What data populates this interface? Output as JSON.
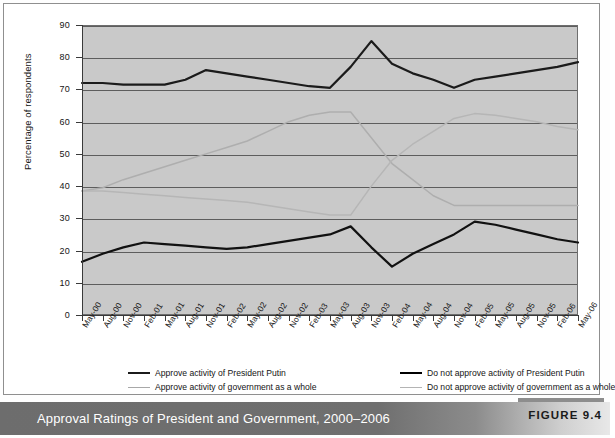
{
  "figure": {
    "caption": "Approval Ratings of President and Government, 2000–2006",
    "number_label": "FIGURE 9.4"
  },
  "chart_data": {
    "type": "line",
    "title": "Approval Ratings of President and Government, 2000–2006",
    "xlabel": "",
    "ylabel": "Percentage of respondents",
    "ylim": [
      0,
      90
    ],
    "yticks": [
      0,
      10,
      20,
      30,
      40,
      50,
      60,
      70,
      80,
      90
    ],
    "grid": true,
    "legend_position": "below-axes",
    "categories": [
      "May-00",
      "Aug-00",
      "Nov-00",
      "Feb-01",
      "May-01",
      "Aug-01",
      "Nov-01",
      "Feb-02",
      "May-02",
      "Aug-02",
      "Nov-02",
      "Feb-03",
      "May-03",
      "Aug-03",
      "Nov-03",
      "Feb-04",
      "May-04",
      "Aug-04",
      "Nov-04",
      "Feb-05",
      "May-05",
      "Aug-05",
      "Nov-05",
      "Feb-06",
      "May-06"
    ],
    "series": [
      {
        "name": "Approve  activity of President Putin",
        "color": "#1b1b1b",
        "width": 2.2,
        "values": [
          72,
          72,
          71.5,
          71.5,
          71.5,
          73,
          76,
          75,
          74,
          73,
          72,
          71,
          70.5,
          77,
          85,
          78,
          75,
          73,
          70.5,
          73,
          74,
          75,
          76,
          77,
          78.5
        ]
      },
      {
        "name": "Do not approve activity of President Putin",
        "color": "#111111",
        "width": 2.2,
        "values": [
          16.5,
          19,
          21,
          22.5,
          22,
          21.5,
          21,
          20.5,
          21,
          22,
          23,
          24,
          25,
          27.5,
          21,
          15,
          19,
          22,
          25,
          29,
          28,
          26.5,
          25,
          23.5,
          22.5
        ]
      },
      {
        "name": "Approve  activity of government as a whole",
        "color": "#aeaeae",
        "width": 1.5,
        "values": [
          38.5,
          39.5,
          42,
          44,
          46,
          48,
          50,
          52,
          54,
          57,
          60,
          62,
          63,
          63,
          55,
          47,
          42,
          37,
          34,
          34,
          34,
          34,
          34,
          34,
          34
        ]
      },
      {
        "name": "Do not approve activity of government as a whole",
        "color": "#b6b6b6",
        "width": 1.5,
        "values": [
          38.5,
          38.5,
          38,
          37.5,
          37,
          36.5,
          36,
          35.5,
          35,
          34,
          33,
          32,
          31,
          31,
          40,
          48,
          53,
          57,
          61,
          62.5,
          62,
          61,
          60,
          58.5,
          57.5
        ]
      }
    ]
  },
  "axes": {
    "y_title": "Percentage of respondents"
  },
  "legend": {
    "items": [
      {
        "label": "Approve  activity of President Putin",
        "swatch": "dark-thick-line"
      },
      {
        "label": "Do not approve activity of President Putin",
        "swatch": "darkest-thick-line"
      },
      {
        "label": "Approve  activity of government as a whole",
        "swatch": "light-thin-line"
      },
      {
        "label": "Do not approve activity of government as a whole",
        "swatch": "light-thin-line"
      }
    ]
  }
}
